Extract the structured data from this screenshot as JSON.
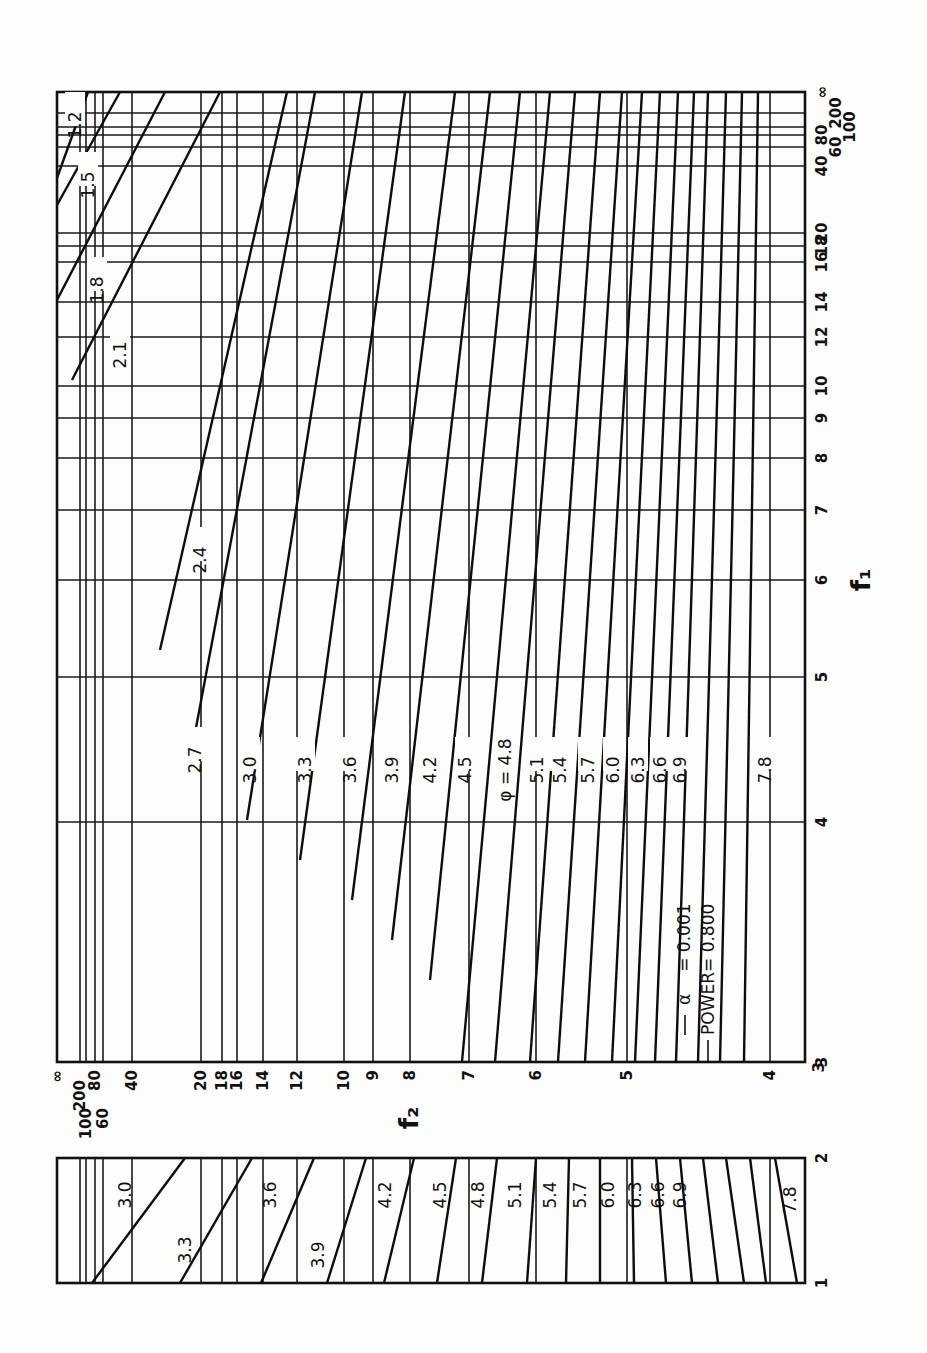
{
  "chart_data": {
    "type": "line",
    "orientation": "rotated 90 degrees counter-clockwise",
    "legend": {
      "alpha_label": "α",
      "alpha_value": "= 0.001",
      "power_label": "POWER",
      "power_value": "= 0.800"
    },
    "phi_prefix": "φ =",
    "xlabel": "f₂",
    "ylabel": "f₁",
    "f1_axis": {
      "title": "f₁",
      "ticks": [
        "∞",
        "200",
        "100",
        "80",
        "60",
        "40",
        "20",
        "18",
        "16",
        "14",
        "12",
        "10",
        "9",
        "8",
        "7",
        "6",
        "5",
        "4",
        "3"
      ],
      "tick_positions_px": [
        92,
        113,
        127,
        135,
        147,
        166,
        233,
        246,
        262,
        302,
        337,
        386,
        418,
        458,
        510,
        580,
        677,
        822,
        1062
      ],
      "secondary_ticks": [
        "2",
        "1"
      ],
      "secondary_positions_px": [
        1158,
        1283
      ]
    },
    "f2_axis": {
      "title": "f₂",
      "ticks": [
        "∞",
        "200",
        "100",
        "80",
        "60",
        "40",
        "20",
        "18",
        "16",
        "14",
        "12",
        "10",
        "9",
        "8",
        "7",
        "6",
        "5",
        "4",
        "3"
      ],
      "tick_positions_px": [
        57,
        80,
        86,
        95,
        103,
        132,
        201,
        222,
        237,
        263,
        297,
        344,
        373,
        410,
        469,
        536,
        627,
        770,
        805
      ]
    },
    "series_main": [
      {
        "name": "1.2",
        "phi": 1.2,
        "from": [
          57,
          178
        ],
        "to": [
          88,
          92
        ],
        "label_at": [
          75,
          125
        ]
      },
      {
        "name": "1.5",
        "phi": 1.5,
        "from": [
          57,
          205
        ],
        "to": [
          120,
          92
        ],
        "label_at": [
          88,
          185
        ]
      },
      {
        "name": "1.8",
        "phi": 1.8,
        "from": [
          57,
          300
        ],
        "to": [
          165,
          92
        ],
        "label_at": [
          97,
          290
        ]
      },
      {
        "name": "2.1",
        "phi": 2.1,
        "from": [
          72,
          380
        ],
        "to": [
          220,
          92
        ],
        "label_at": [
          120,
          355
        ]
      },
      {
        "name": "2.4",
        "phi": 2.4,
        "from": [
          160,
          650
        ],
        "to": [
          287,
          92
        ],
        "label_at": [
          200,
          560
        ]
      },
      {
        "name": "2.7",
        "phi": 2.7,
        "from": [
          190,
          760
        ],
        "to": [
          315,
          92
        ],
        "label_at": [
          195,
          760
        ]
      },
      {
        "name": "3.0",
        "phi": 3.0,
        "from": [
          247,
          820
        ],
        "to": [
          362,
          92
        ],
        "label_at": [
          250,
          770
        ]
      },
      {
        "name": "3.3",
        "phi": 3.3,
        "from": [
          300,
          860
        ],
        "to": [
          405,
          92
        ],
        "label_at": [
          305,
          770
        ]
      },
      {
        "name": "3.6",
        "phi": 3.6,
        "from": [
          352,
          900
        ],
        "to": [
          455,
          92
        ],
        "label_at": [
          350,
          770
        ]
      },
      {
        "name": "3.9",
        "phi": 3.9,
        "from": [
          392,
          940
        ],
        "to": [
          490,
          92
        ],
        "label_at": [
          392,
          770
        ]
      },
      {
        "name": "4.2",
        "phi": 4.2,
        "from": [
          430,
          980
        ],
        "to": [
          520,
          92
        ],
        "label_at": [
          430,
          770
        ]
      },
      {
        "name": "4.5",
        "phi": 4.5,
        "from": [
          462,
          1062
        ],
        "to": [
          550,
          92
        ],
        "label_at": [
          465,
          770
        ]
      },
      {
        "name": "4.8",
        "phi": 4.8,
        "from": [
          495,
          1062
        ],
        "to": [
          575,
          92
        ],
        "label_at": [
          505,
          770
        ]
      },
      {
        "name": "5.1",
        "phi": 5.1,
        "from": [
          530,
          1062
        ],
        "to": [
          600,
          92
        ],
        "label_at": [
          537,
          770
        ]
      },
      {
        "name": "5.4",
        "phi": 5.4,
        "from": [
          558,
          1062
        ],
        "to": [
          622,
          92
        ],
        "label_at": [
          560,
          770
        ]
      },
      {
        "name": "5.7",
        "phi": 5.7,
        "from": [
          585,
          1062
        ],
        "to": [
          642,
          92
        ],
        "label_at": [
          588,
          770
        ]
      },
      {
        "name": "6.0",
        "phi": 6.0,
        "from": [
          612,
          1062
        ],
        "to": [
          660,
          92
        ],
        "label_at": [
          613,
          770
        ]
      },
      {
        "name": "6.3",
        "phi": 6.3,
        "from": [
          635,
          1062
        ],
        "to": [
          678,
          92
        ],
        "label_at": [
          638,
          770
        ]
      },
      {
        "name": "6.6",
        "phi": 6.6,
        "from": [
          655,
          1062
        ],
        "to": [
          694,
          92
        ],
        "label_at": [
          660,
          770
        ]
      },
      {
        "name": "6.9",
        "phi": 6.9,
        "from": [
          676,
          1062
        ],
        "to": [
          708,
          92
        ],
        "label_at": [
          680,
          770
        ]
      },
      {
        "name": "",
        "phi": 7.2,
        "from": [
          698,
          1062
        ],
        "to": [
          726,
          92
        ],
        "label_at": null
      },
      {
        "name": "",
        "phi": 7.5,
        "from": [
          720,
          1062
        ],
        "to": [
          742,
          92
        ],
        "label_at": null
      },
      {
        "name": "7.8",
        "phi": 7.8,
        "from": [
          744,
          1062
        ],
        "to": [
          758,
          92
        ],
        "label_at": [
          765,
          770
        ]
      }
    ],
    "series_lower": [
      {
        "name": "3.0",
        "from": [
          92,
          1283
        ],
        "to": [
          185,
          1158
        ]
      },
      {
        "name": "3.3",
        "from": [
          180,
          1283
        ],
        "to": [
          252,
          1158
        ]
      },
      {
        "name": "3.6",
        "from": [
          261,
          1283
        ],
        "to": [
          314,
          1158
        ]
      },
      {
        "name": "3.9",
        "from": [
          327,
          1283
        ],
        "to": [
          366,
          1158
        ]
      },
      {
        "name": "4.2",
        "from": [
          384,
          1283
        ],
        "to": [
          414,
          1158
        ]
      },
      {
        "name": "4.5",
        "from": [
          437,
          1283
        ],
        "to": [
          456,
          1158
        ]
      },
      {
        "name": "4.8",
        "from": [
          482,
          1283
        ],
        "to": [
          497,
          1158
        ]
      },
      {
        "name": "5.1",
        "from": [
          527,
          1283
        ],
        "to": [
          536,
          1158
        ]
      },
      {
        "name": "5.4",
        "from": [
          566,
          1283
        ],
        "to": [
          569,
          1158
        ]
      },
      {
        "name": "5.7",
        "from": [
          600,
          1283
        ],
        "to": [
          600,
          1158
        ]
      },
      {
        "name": "6.0",
        "from": [
          634,
          1283
        ],
        "to": [
          632,
          1158
        ]
      },
      {
        "name": "6.3",
        "from": [
          666,
          1283
        ],
        "to": [
          656,
          1158
        ]
      },
      {
        "name": "6.6",
        "from": [
          692,
          1283
        ],
        "to": [
          680,
          1158
        ]
      },
      {
        "name": "6.9",
        "from": [
          718,
          1283
        ],
        "to": [
          703,
          1158
        ]
      },
      {
        "name": "",
        "from": [
          744,
          1283
        ],
        "to": [
          726,
          1158
        ]
      },
      {
        "name": "",
        "from": [
          766,
          1283
        ],
        "to": [
          750,
          1158
        ]
      },
      {
        "name": "7.8",
        "from": [
          797,
          1283
        ],
        "to": [
          775,
          1158
        ]
      }
    ],
    "grid": true,
    "legend_position": "inside main chart, lower-right region"
  }
}
